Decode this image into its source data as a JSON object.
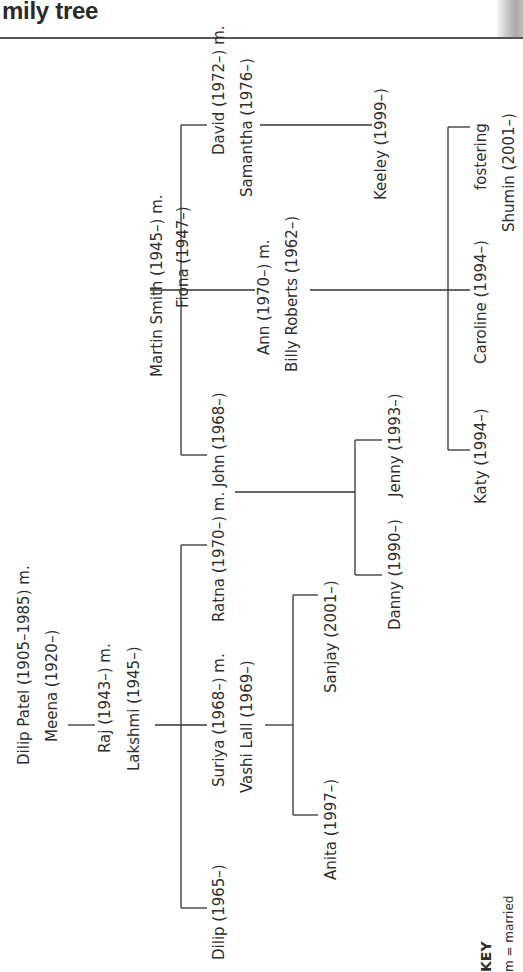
{
  "header": {
    "title": "mily tree"
  },
  "key": {
    "title": "KEY",
    "text": "m = married"
  },
  "people": {
    "dilip_patel": "Dilip Patel (1905–1985) m.",
    "meena": "Meena (1920–)",
    "raj": "Raj (1943–) m.",
    "lakshmi": "Lakshmi (1945–)",
    "dilip": "Dilip (1965–)",
    "suriya": "Suriya (1968–) m.",
    "vashi": "Vashi Lall (1969–)",
    "ratna_john": "Ratna (1970–) m. John (1968–)",
    "anita": "Anita (1997–)",
    "sanjay": "Sanjay (2001–)",
    "danny": "Danny (1990–)",
    "jenny": "Jenny (1993–)",
    "martin": "Martin Smith (1945–) m.",
    "fiona": "Fiona (1947–)",
    "david": "David (1972–) m.",
    "samantha": "Samantha (1976–)",
    "ann": "Ann (1970–) m.",
    "billy": "Billy Roberts (1962–)",
    "keeley": "Keeley (1999–)",
    "katy": "Katy (1994–)",
    "caroline": "Caroline (1994–)",
    "fostering": "fostering",
    "shumin": "Shumin (2001–)"
  },
  "colors": {
    "line": "#333333",
    "text": "#2e2e2e"
  }
}
